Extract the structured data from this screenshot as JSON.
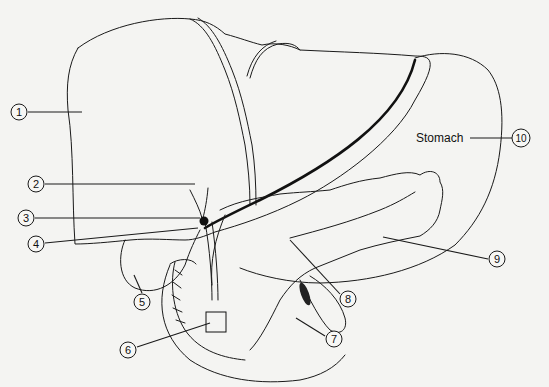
{
  "diagram": {
    "text_labels": [
      {
        "id": "stomach",
        "text": "Stomach",
        "callout": "10"
      }
    ],
    "callouts": [
      {
        "number": "1",
        "x": 19,
        "y": 112,
        "target": "liver right lobe"
      },
      {
        "number": "2",
        "x": 36,
        "y": 184,
        "target": "hepatic duct"
      },
      {
        "number": "3",
        "x": 26,
        "y": 218,
        "target": "cystic duct junction"
      },
      {
        "number": "4",
        "x": 36,
        "y": 244,
        "target": "common bile duct"
      },
      {
        "number": "5",
        "x": 142,
        "y": 302,
        "target": "gallbladder"
      },
      {
        "number": "6",
        "x": 128,
        "y": 350,
        "target": "duodenal papilla"
      },
      {
        "number": "7",
        "x": 334,
        "y": 339,
        "target": "jejunum"
      },
      {
        "number": "8",
        "x": 348,
        "y": 299,
        "target": "pancreatic duct"
      },
      {
        "number": "9",
        "x": 497,
        "y": 259,
        "target": "pancreas"
      },
      {
        "number": "10",
        "x": 521,
        "y": 138,
        "target": "stomach"
      }
    ]
  }
}
